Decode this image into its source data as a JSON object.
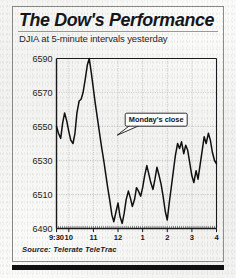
{
  "figure": {
    "headline": "The Dow's Performance",
    "subhead": "DJIA at 5-minute intervals yesterday",
    "source": "Source: Telerate TeleTrac",
    "annotation": "Monday's close"
  },
  "colors": {
    "line": "#111114",
    "axis": "#1a1a1d",
    "grid": "#b9b9b4",
    "text": "#16161a",
    "paper": "#f7f7f5",
    "bottom_bar": "#111114"
  },
  "chart_data": {
    "type": "line",
    "title": "The Dow's Performance",
    "subtitle": "DJIA at 5-minute intervals yesterday",
    "xlabel": "",
    "ylabel": "DJIA",
    "ylim": [
      6490,
      6590
    ],
    "yticks": [
      6590,
      6570,
      6550,
      6530,
      6510,
      6490
    ],
    "ytick_labels": [
      "6590",
      "6570",
      "6550",
      "6530",
      "6510",
      "6490"
    ],
    "xticks": [
      0,
      0.5,
      1.5,
      2.5,
      3.5,
      4.5,
      5.5,
      6.5
    ],
    "xtick_labels": [
      "9:30",
      "10",
      "11",
      "12",
      "1",
      "2",
      "3",
      "4"
    ],
    "xlim": [
      0,
      6.5
    ],
    "grid": true,
    "legend": null,
    "annotations": [
      {
        "text": "Monday's close",
        "x": 4.05,
        "y": 6554,
        "note": "callout box with pointer to the reference level"
      }
    ],
    "reference_line": {
      "label": "Monday's close",
      "value": 6549
    },
    "series": [
      {
        "name": "DJIA",
        "x": [
          0.0,
          0.08,
          0.17,
          0.25,
          0.33,
          0.42,
          0.5,
          0.58,
          0.67,
          0.75,
          0.83,
          0.92,
          1.0,
          1.08,
          1.17,
          1.25,
          1.33,
          1.42,
          1.5,
          1.58,
          1.67,
          1.75,
          1.83,
          1.92,
          2.0,
          2.08,
          2.17,
          2.25,
          2.33,
          2.42,
          2.5,
          2.58,
          2.67,
          2.75,
          2.83,
          2.92,
          3.0,
          3.08,
          3.17,
          3.25,
          3.33,
          3.42,
          3.5,
          3.58,
          3.67,
          3.75,
          3.83,
          3.92,
          4.0,
          4.08,
          4.17,
          4.25,
          4.33,
          4.42,
          4.5,
          4.58,
          4.67,
          4.75,
          4.83,
          4.92,
          5.0,
          5.08,
          5.17,
          5.25,
          5.33,
          5.42,
          5.5,
          5.58,
          5.67,
          5.75,
          5.83,
          5.92,
          6.0,
          6.08,
          6.17,
          6.25,
          6.33,
          6.42,
          6.5
        ],
        "y": [
          6550,
          6546,
          6543,
          6552,
          6558,
          6553,
          6547,
          6542,
          6540,
          6546,
          6558,
          6565,
          6566,
          6570,
          6578,
          6586,
          6590,
          6581,
          6572,
          6563,
          6554,
          6546,
          6538,
          6530,
          6522,
          6514,
          6506,
          6498,
          6494,
          6500,
          6505,
          6497,
          6493,
          6499,
          6507,
          6512,
          6508,
          6503,
          6507,
          6514,
          6512,
          6509,
          6514,
          6521,
          6527,
          6522,
          6517,
          6513,
          6519,
          6526,
          6521,
          6516,
          6509,
          6500,
          6495,
          6505,
          6515,
          6524,
          6533,
          6540,
          6537,
          6541,
          6534,
          6539,
          6536,
          6528,
          6521,
          6517,
          6524,
          6519,
          6527,
          6536,
          6544,
          6540,
          6546,
          6542,
          6535,
          6530,
          6528
        ]
      }
    ]
  }
}
